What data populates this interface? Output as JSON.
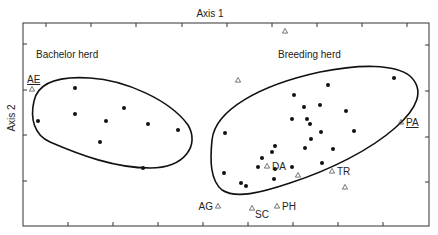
{
  "chart_data": {
    "type": "scatter",
    "title": "",
    "xlabel": "Axis 1",
    "ylabel": "Axis 2",
    "grid": false,
    "legend": null,
    "axes_box": {
      "left": 23,
      "top": 23,
      "right": 429,
      "bottom": 226
    },
    "ticks": {
      "top": [
        46,
        91,
        136,
        182,
        227,
        272,
        317,
        362,
        407
      ],
      "bottom": [
        68,
        113,
        158,
        203,
        248,
        293,
        338,
        383
      ],
      "left": [
        44,
        90,
        135,
        181
      ],
      "right": [
        45,
        91,
        137,
        182
      ]
    },
    "group_labels": [
      {
        "text": "Bachelor herd",
        "x": 36,
        "y": 64
      },
      {
        "text": "Breeding herd",
        "x": 278,
        "y": 64
      }
    ],
    "series": [
      {
        "name": "Bachelor herd",
        "marker": "filled-circle",
        "points": [
          [
            75,
            88
          ],
          [
            124,
            108
          ],
          [
            38,
            121
          ],
          [
            75,
            114
          ],
          [
            106,
            121
          ],
          [
            148,
            124
          ],
          [
            178,
            130
          ],
          [
            100,
            142
          ],
          [
            143,
            168
          ]
        ]
      },
      {
        "name": "Breeding herd",
        "marker": "filled-circle",
        "points": [
          [
            394,
            78
          ],
          [
            328,
            85
          ],
          [
            294,
            95
          ],
          [
            304,
            107
          ],
          [
            320,
            105
          ],
          [
            346,
            111
          ],
          [
            292,
            119
          ],
          [
            307,
            119
          ],
          [
            310,
            124
          ],
          [
            321,
            132
          ],
          [
            354,
            131
          ],
          [
            311,
            139
          ],
          [
            305,
            148
          ],
          [
            333,
            149
          ],
          [
            275,
            146
          ],
          [
            272,
            152
          ],
          [
            225,
            133
          ],
          [
            262,
            158
          ],
          [
            258,
            167
          ],
          [
            275,
            169
          ],
          [
            292,
            167
          ],
          [
            322,
            163
          ],
          [
            224,
            173
          ],
          [
            274,
            179
          ],
          [
            241,
            183
          ],
          [
            246,
            186
          ]
        ]
      },
      {
        "name": "Unlabelled / labelled individuals",
        "marker": "open-triangle",
        "points": [
          {
            "x": 32,
            "y": 89,
            "label": "AE",
            "underline": true
          },
          {
            "x": 285,
            "y": 31,
            "label": ""
          },
          {
            "x": 238,
            "y": 80,
            "label": ""
          },
          {
            "x": 401,
            "y": 122,
            "label": "PA",
            "underline": true
          },
          {
            "x": 267,
            "y": 166,
            "label": "DA"
          },
          {
            "x": 298,
            "y": 175,
            "label": ""
          },
          {
            "x": 332,
            "y": 171,
            "label": "TR"
          },
          {
            "x": 345,
            "y": 187,
            "label": ""
          },
          {
            "x": 218,
            "y": 206,
            "label": "AG",
            "label_side": "left"
          },
          {
            "x": 252,
            "y": 208,
            "label": "SC",
            "label_side": "below-right"
          },
          {
            "x": 277,
            "y": 206,
            "label": "PH"
          }
        ]
      }
    ],
    "enclosures": [
      {
        "name": "Bachelor herd",
        "path": "M 34 101 C 38 82, 60 76, 90 78 C 125 80, 170 100, 188 125 C 200 145, 185 168, 150 168 C 115 168, 80 155, 50 142 C 34 135, 30 118, 34 101 Z"
      },
      {
        "name": "Breeding herd",
        "path": "M 212 140 C 215 110, 260 85, 320 72 C 360 64, 395 64, 410 76 C 425 90, 418 108, 395 128 C 370 150, 330 170, 290 183 C 260 193, 236 199, 222 190 C 210 180, 210 160, 212 140 Z"
      }
    ]
  }
}
